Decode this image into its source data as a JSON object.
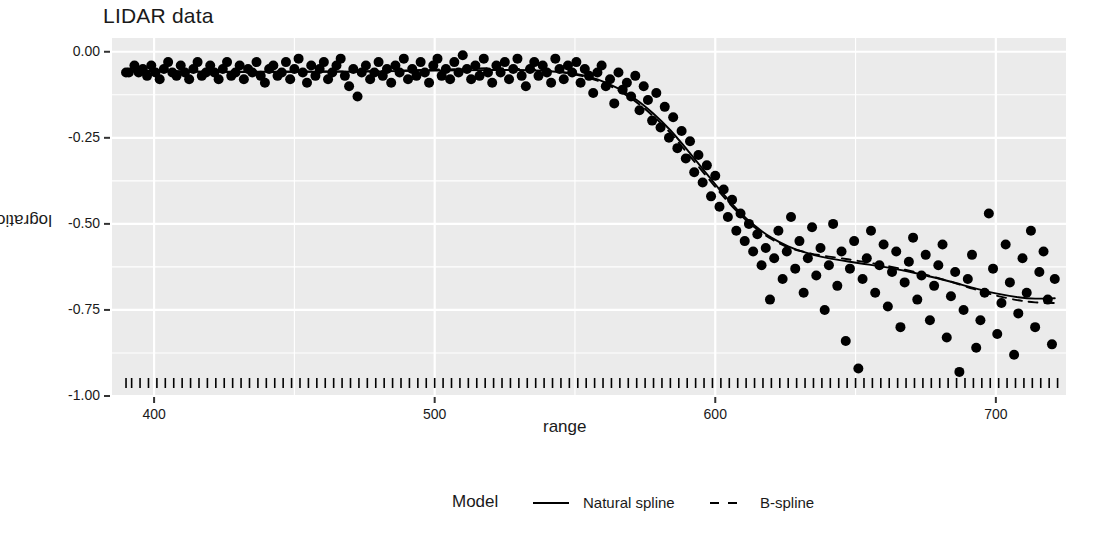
{
  "chart_data": {
    "type": "scatter",
    "title": "LIDAR data",
    "xlabel": "range",
    "ylabel": "logratio",
    "xlim": [
      385,
      725
    ],
    "ylim": [
      -1.0,
      0.04
    ],
    "xticks": [
      400,
      500,
      600,
      700
    ],
    "xtick_labels": [
      "400",
      "500",
      "600",
      "700"
    ],
    "yticks": [
      0.0,
      -0.25,
      -0.5,
      -0.75,
      -1.0
    ],
    "ytick_labels": [
      "0.00",
      "-0.25",
      "-0.50",
      "-0.75",
      "-1.00"
    ],
    "grid": true,
    "panel_background": "#ebebeb",
    "grid_color": "#ffffff",
    "point_color": "#000000",
    "point_size": 5,
    "legend": {
      "title": "Model",
      "position": "bottom",
      "entries": [
        {
          "label": "Natural spline",
          "linetype": "solid",
          "color": "#000000"
        },
        {
          "label": "B-spline",
          "linetype": "dashed",
          "color": "#000000"
        }
      ]
    },
    "points": [
      [
        390.0,
        -0.06
      ],
      [
        391.0,
        -0.06
      ],
      [
        393.0,
        -0.04
      ],
      [
        394.5,
        -0.06
      ],
      [
        396.0,
        -0.05
      ],
      [
        397.5,
        -0.07
      ],
      [
        399.0,
        -0.04
      ],
      [
        400.5,
        -0.06
      ],
      [
        402.0,
        -0.08
      ],
      [
        403.5,
        -0.05
      ],
      [
        405.0,
        -0.03
      ],
      [
        406.5,
        -0.06
      ],
      [
        408.0,
        -0.07
      ],
      [
        409.5,
        -0.04
      ],
      [
        411.0,
        -0.06
      ],
      [
        412.5,
        -0.08
      ],
      [
        414.0,
        -0.05
      ],
      [
        415.5,
        -0.03
      ],
      [
        417.0,
        -0.07
      ],
      [
        418.5,
        -0.06
      ],
      [
        420.0,
        -0.04
      ],
      [
        421.5,
        -0.06
      ],
      [
        423.0,
        -0.08
      ],
      [
        424.5,
        -0.05
      ],
      [
        426.0,
        -0.03
      ],
      [
        427.5,
        -0.07
      ],
      [
        429.0,
        -0.06
      ],
      [
        430.5,
        -0.04
      ],
      [
        432.0,
        -0.08
      ],
      [
        433.5,
        -0.05
      ],
      [
        435.0,
        -0.06
      ],
      [
        436.5,
        -0.03
      ],
      [
        438.0,
        -0.07
      ],
      [
        439.5,
        -0.09
      ],
      [
        441.0,
        -0.05
      ],
      [
        442.5,
        -0.04
      ],
      [
        444.0,
        -0.07
      ],
      [
        445.5,
        -0.06
      ],
      [
        447.0,
        -0.03
      ],
      [
        448.5,
        -0.08
      ],
      [
        450.0,
        -0.05
      ],
      [
        451.5,
        -0.02
      ],
      [
        453.0,
        -0.06
      ],
      [
        454.5,
        -0.09
      ],
      [
        456.0,
        -0.04
      ],
      [
        457.5,
        -0.07
      ],
      [
        459.0,
        -0.05
      ],
      [
        460.5,
        -0.03
      ],
      [
        462.0,
        -0.08
      ],
      [
        463.5,
        -0.06
      ],
      [
        465.0,
        -0.04
      ],
      [
        466.5,
        -0.02
      ],
      [
        468.0,
        -0.07
      ],
      [
        469.5,
        -0.1
      ],
      [
        471.0,
        -0.05
      ],
      [
        472.5,
        -0.13
      ],
      [
        474.0,
        -0.06
      ],
      [
        475.5,
        -0.04
      ],
      [
        477.0,
        -0.08
      ],
      [
        478.5,
        -0.06
      ],
      [
        480.0,
        -0.03
      ],
      [
        481.5,
        -0.07
      ],
      [
        483.0,
        -0.05
      ],
      [
        484.5,
        -0.09
      ],
      [
        486.0,
        -0.04
      ],
      [
        487.5,
        -0.06
      ],
      [
        489.0,
        -0.02
      ],
      [
        490.5,
        -0.08
      ],
      [
        492.0,
        -0.05
      ],
      [
        493.5,
        -0.07
      ],
      [
        495.0,
        -0.03
      ],
      [
        496.5,
        -0.06
      ],
      [
        498.0,
        -0.09
      ],
      [
        499.5,
        -0.04
      ],
      [
        501.0,
        -0.02
      ],
      [
        502.5,
        -0.07
      ],
      [
        504.0,
        -0.05
      ],
      [
        505.5,
        -0.08
      ],
      [
        507.0,
        -0.03
      ],
      [
        508.5,
        -0.06
      ],
      [
        510.0,
        -0.01
      ],
      [
        511.5,
        -0.05
      ],
      [
        513.0,
        -0.08
      ],
      [
        514.5,
        -0.04
      ],
      [
        516.0,
        -0.07
      ],
      [
        517.5,
        -0.02
      ],
      [
        519.0,
        -0.06
      ],
      [
        520.5,
        -0.09
      ],
      [
        522.0,
        -0.04
      ],
      [
        523.5,
        -0.06
      ],
      [
        525.0,
        -0.03
      ],
      [
        526.5,
        -0.08
      ],
      [
        528.0,
        -0.05
      ],
      [
        529.5,
        -0.02
      ],
      [
        531.0,
        -0.07
      ],
      [
        532.5,
        -0.1
      ],
      [
        534.0,
        -0.05
      ],
      [
        535.5,
        -0.03
      ],
      [
        537.0,
        -0.07
      ],
      [
        538.5,
        -0.04
      ],
      [
        540.0,
        -0.06
      ],
      [
        541.5,
        -0.09
      ],
      [
        543.0,
        -0.02
      ],
      [
        544.5,
        -0.05
      ],
      [
        546.0,
        -0.08
      ],
      [
        547.5,
        -0.04
      ],
      [
        549.0,
        -0.06
      ],
      [
        550.5,
        -0.03
      ],
      [
        552.0,
        -0.09
      ],
      [
        553.5,
        -0.05
      ],
      [
        555.0,
        -0.07
      ],
      [
        556.5,
        -0.12
      ],
      [
        558.0,
        -0.06
      ],
      [
        559.5,
        -0.04
      ],
      [
        561.0,
        -0.1
      ],
      [
        562.5,
        -0.08
      ],
      [
        564.0,
        -0.15
      ],
      [
        565.5,
        -0.06
      ],
      [
        567.0,
        -0.11
      ],
      [
        568.5,
        -0.09
      ],
      [
        570.0,
        -0.13
      ],
      [
        571.5,
        -0.07
      ],
      [
        573.0,
        -0.17
      ],
      [
        574.5,
        -0.1
      ],
      [
        576.0,
        -0.14
      ],
      [
        577.5,
        -0.2
      ],
      [
        579.0,
        -0.12
      ],
      [
        580.5,
        -0.22
      ],
      [
        582.0,
        -0.16
      ],
      [
        583.5,
        -0.25
      ],
      [
        585.0,
        -0.19
      ],
      [
        586.5,
        -0.28
      ],
      [
        588.0,
        -0.23
      ],
      [
        589.5,
        -0.31
      ],
      [
        591.0,
        -0.26
      ],
      [
        592.5,
        -0.35
      ],
      [
        594.0,
        -0.3
      ],
      [
        595.5,
        -0.38
      ],
      [
        597.0,
        -0.33
      ],
      [
        598.5,
        -0.42
      ],
      [
        600.0,
        -0.36
      ],
      [
        601.5,
        -0.45
      ],
      [
        603.0,
        -0.4
      ],
      [
        604.5,
        -0.48
      ],
      [
        606.0,
        -0.43
      ],
      [
        607.5,
        -0.52
      ],
      [
        609.0,
        -0.47
      ],
      [
        610.5,
        -0.55
      ],
      [
        612.0,
        -0.5
      ],
      [
        613.5,
        -0.58
      ],
      [
        615.0,
        -0.53
      ],
      [
        616.5,
        -0.62
      ],
      [
        618.0,
        -0.57
      ],
      [
        619.5,
        -0.72
      ],
      [
        621.0,
        -0.6
      ],
      [
        622.5,
        -0.52
      ],
      [
        624.0,
        -0.66
      ],
      [
        625.5,
        -0.58
      ],
      [
        627.0,
        -0.48
      ],
      [
        628.5,
        -0.63
      ],
      [
        630.0,
        -0.55
      ],
      [
        631.5,
        -0.7
      ],
      [
        633.0,
        -0.6
      ],
      [
        634.5,
        -0.51
      ],
      [
        636.0,
        -0.65
      ],
      [
        637.5,
        -0.57
      ],
      [
        639.0,
        -0.75
      ],
      [
        640.5,
        -0.62
      ],
      [
        642.0,
        -0.5
      ],
      [
        643.5,
        -0.68
      ],
      [
        645.0,
        -0.58
      ],
      [
        646.5,
        -0.84
      ],
      [
        648.0,
        -0.63
      ],
      [
        649.5,
        -0.55
      ],
      [
        651.0,
        -0.92
      ],
      [
        652.5,
        -0.66
      ],
      [
        654.0,
        -0.6
      ],
      [
        655.5,
        -0.52
      ],
      [
        657.0,
        -0.7
      ],
      [
        658.5,
        -0.62
      ],
      [
        660.0,
        -0.56
      ],
      [
        661.5,
        -0.74
      ],
      [
        663.0,
        -0.64
      ],
      [
        664.5,
        -0.58
      ],
      [
        666.0,
        -0.8
      ],
      [
        667.5,
        -0.67
      ],
      [
        669.0,
        -0.61
      ],
      [
        670.5,
        -0.54
      ],
      [
        672.0,
        -0.72
      ],
      [
        673.5,
        -0.65
      ],
      [
        675.0,
        -0.59
      ],
      [
        676.5,
        -0.78
      ],
      [
        678.0,
        -0.68
      ],
      [
        679.5,
        -0.62
      ],
      [
        681.0,
        -0.56
      ],
      [
        682.5,
        -0.83
      ],
      [
        684.0,
        -0.71
      ],
      [
        685.5,
        -0.64
      ],
      [
        687.0,
        -0.93
      ],
      [
        688.5,
        -0.75
      ],
      [
        690.0,
        -0.66
      ],
      [
        691.5,
        -0.59
      ],
      [
        693.0,
        -0.86
      ],
      [
        694.5,
        -0.78
      ],
      [
        696.0,
        -0.7
      ],
      [
        697.5,
        -0.47
      ],
      [
        699.0,
        -0.63
      ],
      [
        700.5,
        -0.82
      ],
      [
        702.0,
        -0.73
      ],
      [
        703.5,
        -0.56
      ],
      [
        705.0,
        -0.67
      ],
      [
        706.5,
        -0.88
      ],
      [
        708.0,
        -0.76
      ],
      [
        709.5,
        -0.6
      ],
      [
        711.0,
        -0.7
      ],
      [
        712.5,
        -0.52
      ],
      [
        714.0,
        -0.8
      ],
      [
        715.5,
        -0.64
      ],
      [
        717.0,
        -0.58
      ],
      [
        718.5,
        -0.72
      ],
      [
        720.0,
        -0.85
      ],
      [
        721.0,
        -0.66
      ]
    ],
    "series": [
      {
        "name": "Natural spline",
        "linetype": "solid",
        "points": [
          [
            390,
            -0.055
          ],
          [
            405,
            -0.056
          ],
          [
            420,
            -0.058
          ],
          [
            435,
            -0.058
          ],
          [
            450,
            -0.058
          ],
          [
            465,
            -0.058
          ],
          [
            480,
            -0.057
          ],
          [
            495,
            -0.055
          ],
          [
            510,
            -0.054
          ],
          [
            520,
            -0.053
          ],
          [
            530,
            -0.053
          ],
          [
            540,
            -0.056
          ],
          [
            550,
            -0.064
          ],
          [
            558,
            -0.08
          ],
          [
            565,
            -0.105
          ],
          [
            572,
            -0.14
          ],
          [
            578,
            -0.18
          ],
          [
            584,
            -0.228
          ],
          [
            590,
            -0.285
          ],
          [
            596,
            -0.345
          ],
          [
            602,
            -0.405
          ],
          [
            608,
            -0.46
          ],
          [
            614,
            -0.505
          ],
          [
            620,
            -0.54
          ],
          [
            626,
            -0.565
          ],
          [
            632,
            -0.583
          ],
          [
            638,
            -0.596
          ],
          [
            645,
            -0.606
          ],
          [
            652,
            -0.615
          ],
          [
            660,
            -0.625
          ],
          [
            668,
            -0.637
          ],
          [
            676,
            -0.652
          ],
          [
            684,
            -0.668
          ],
          [
            692,
            -0.686
          ],
          [
            700,
            -0.702
          ],
          [
            708,
            -0.713
          ],
          [
            714,
            -0.717
          ],
          [
            721,
            -0.716
          ]
        ]
      },
      {
        "name": "B-spline",
        "linetype": "dashed",
        "points": [
          [
            390,
            -0.058
          ],
          [
            405,
            -0.057
          ],
          [
            420,
            -0.058
          ],
          [
            435,
            -0.059
          ],
          [
            450,
            -0.058
          ],
          [
            465,
            -0.057
          ],
          [
            480,
            -0.056
          ],
          [
            495,
            -0.053
          ],
          [
            510,
            -0.05
          ],
          [
            520,
            -0.048
          ],
          [
            530,
            -0.05
          ],
          [
            540,
            -0.055
          ],
          [
            550,
            -0.066
          ],
          [
            558,
            -0.084
          ],
          [
            565,
            -0.11
          ],
          [
            572,
            -0.147
          ],
          [
            578,
            -0.188
          ],
          [
            584,
            -0.236
          ],
          [
            590,
            -0.294
          ],
          [
            596,
            -0.353
          ],
          [
            602,
            -0.412
          ],
          [
            608,
            -0.466
          ],
          [
            614,
            -0.51
          ],
          [
            620,
            -0.544
          ],
          [
            626,
            -0.568
          ],
          [
            632,
            -0.582
          ],
          [
            638,
            -0.592
          ],
          [
            645,
            -0.6
          ],
          [
            652,
            -0.609
          ],
          [
            660,
            -0.62
          ],
          [
            668,
            -0.634
          ],
          [
            676,
            -0.65
          ],
          [
            684,
            -0.668
          ],
          [
            692,
            -0.689
          ],
          [
            700,
            -0.708
          ],
          [
            708,
            -0.722
          ],
          [
            714,
            -0.728
          ],
          [
            721,
            -0.73
          ]
        ]
      }
    ],
    "rug": [
      390,
      392,
      395,
      398,
      401,
      404,
      407,
      410,
      413,
      416,
      419,
      422,
      425,
      428,
      431,
      434,
      437,
      440,
      443,
      446,
      449,
      452,
      455,
      458,
      461,
      464,
      467,
      470,
      473,
      476,
      479,
      482,
      485,
      488,
      491,
      494,
      497,
      500,
      503,
      506,
      509,
      512,
      515,
      518,
      521,
      524,
      527,
      530,
      533,
      536,
      539,
      542,
      545,
      548,
      551,
      554,
      557,
      560,
      563,
      566,
      569,
      572,
      575,
      578,
      581,
      584,
      587,
      590,
      593,
      596,
      599,
      602,
      605,
      608,
      611,
      614,
      617,
      620,
      623,
      626,
      629,
      632,
      635,
      638,
      641,
      644,
      647,
      650,
      653,
      656,
      659,
      662,
      665,
      668,
      671,
      674,
      677,
      680,
      683,
      686,
      689,
      692,
      695,
      698,
      701,
      704,
      707,
      710,
      713,
      716,
      719,
      722
    ]
  }
}
